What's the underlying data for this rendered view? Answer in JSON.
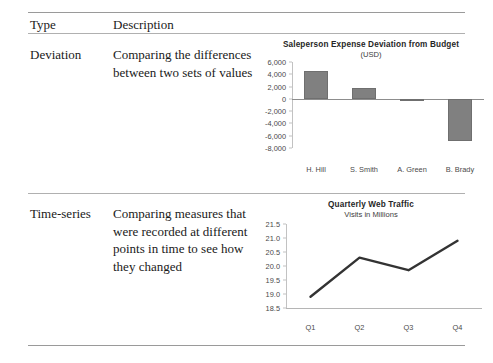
{
  "table": {
    "headers": {
      "type": "Type",
      "description": "Description"
    },
    "rows": [
      {
        "type": "Deviation",
        "description": "Comparing the differences between two sets of values"
      },
      {
        "type": "Time-series",
        "description": "Comparing measures that were recorded at different points in time to see how they changed"
      }
    ]
  },
  "colors": {
    "bar_fill": "#808080",
    "bar_stroke": "#6f6f6f",
    "line_stroke": "#333333",
    "axis": "#b5b5b5",
    "rule": "#b0b0b0",
    "text": "#1a1a1a"
  },
  "chart_data": [
    {
      "type": "bar",
      "title": "Saleperson Expense Deviation from Budget",
      "subtitle": "(USD)",
      "categories": [
        "H. Hill",
        "S. Smith",
        "A. Green",
        "B. Brady"
      ],
      "values": [
        4500,
        1800,
        -400,
        -6800
      ],
      "xlabel": "",
      "ylabel": "",
      "ylim": [
        -8000,
        6000
      ],
      "yticks": [
        6000,
        4000,
        2000,
        0,
        -2000,
        -4000,
        -6000,
        -8000
      ],
      "ytick_labels": [
        "6,000",
        "4,000",
        "2,000",
        "0",
        "-2,000",
        "-4,000",
        "-6,000",
        "-8,000"
      ],
      "grid": false,
      "legend": "none"
    },
    {
      "type": "line",
      "title": "Quarterly Web Traffic",
      "subtitle": "Visits in Millions",
      "categories": [
        "Q1",
        "Q2",
        "Q3",
        "Q4"
      ],
      "values": [
        18.9,
        20.3,
        19.85,
        20.9
      ],
      "xlabel": "",
      "ylabel": "",
      "ylim": [
        18.5,
        21.5
      ],
      "yticks": [
        21.5,
        21.0,
        20.5,
        20.0,
        19.5,
        19.0,
        18.5
      ],
      "ytick_labels": [
        "21.5",
        "21.0",
        "20.5",
        "20.0",
        "19.5",
        "19.0",
        "18.5"
      ],
      "grid": false,
      "legend": "none"
    }
  ]
}
